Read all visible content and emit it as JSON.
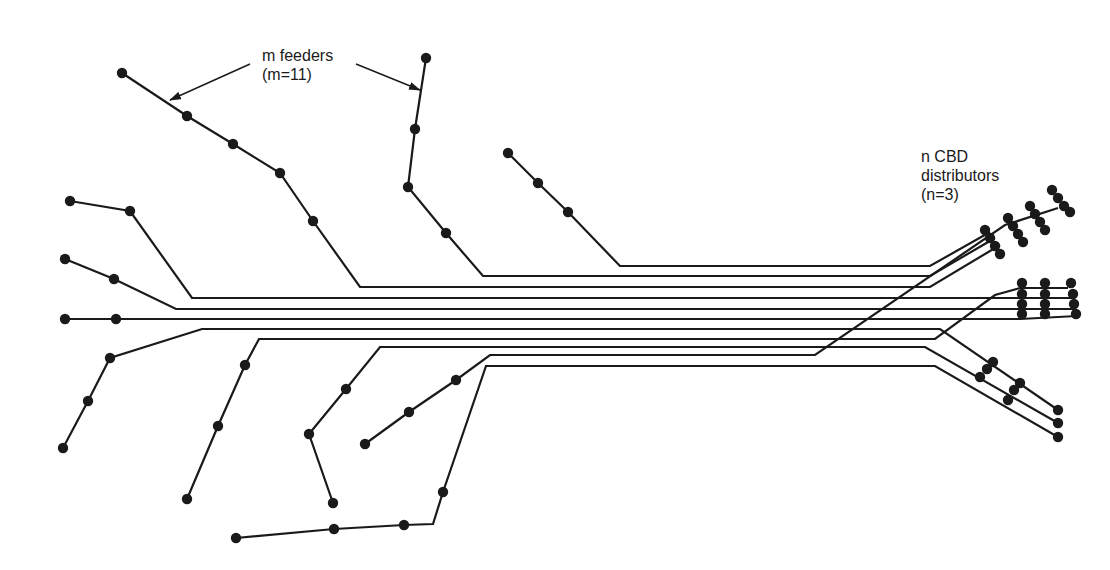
{
  "diagram": {
    "stroke_color": "#1a1a1a",
    "background": "#ffffff",
    "labels": {
      "feeders_line1": "m feeders",
      "feeders_line2": "(m=11)",
      "distributors_line1": "n CBD",
      "distributors_line2": "distributors",
      "distributors_line3": "(n=3)"
    },
    "annotation_arrows": [
      {
        "from": [
          250,
          64
        ],
        "to": [
          170,
          100
        ]
      },
      {
        "from": [
          356,
          64
        ],
        "to": [
          420,
          90
        ]
      }
    ],
    "feeders": [
      {
        "id": "f1",
        "points": [
          [
            122,
            73
          ],
          [
            187,
            116
          ],
          [
            233,
            144
          ],
          [
            280,
            173
          ],
          [
            313,
            221
          ],
          [
            360,
            287
          ],
          [
            930,
            287
          ],
          [
            1000,
            245
          ]
        ],
        "nodes": [
          [
            122,
            73
          ],
          [
            187,
            116
          ],
          [
            233,
            144
          ],
          [
            280,
            173
          ],
          [
            313,
            221
          ]
        ]
      },
      {
        "id": "f2",
        "points": [
          [
            426,
            58
          ],
          [
            415,
            129
          ],
          [
            408,
            187
          ],
          [
            446,
            233
          ],
          [
            483,
            276
          ],
          [
            930,
            276
          ],
          [
            995,
            238
          ]
        ],
        "nodes": [
          [
            426,
            58
          ],
          [
            415,
            129
          ],
          [
            408,
            187
          ],
          [
            446,
            233
          ]
        ]
      },
      {
        "id": "f3",
        "points": [
          [
            508,
            153
          ],
          [
            538,
            183
          ],
          [
            568,
            212
          ],
          [
            620,
            266
          ],
          [
            930,
            266
          ],
          [
            990,
            232
          ]
        ],
        "nodes": [
          [
            508,
            153
          ],
          [
            538,
            183
          ],
          [
            568,
            212
          ]
        ]
      },
      {
        "id": "f4",
        "points": [
          [
            70,
            201
          ],
          [
            130,
            211
          ],
          [
            192,
            298
          ],
          [
            1020,
            298
          ],
          [
            1071,
            298
          ]
        ],
        "nodes": [
          [
            70,
            201
          ],
          [
            130,
            211
          ]
        ]
      },
      {
        "id": "f5",
        "points": [
          [
            65,
            259
          ],
          [
            114,
            279
          ],
          [
            176,
            309
          ],
          [
            1020,
            309
          ],
          [
            1075,
            309
          ]
        ],
        "nodes": [
          [
            65,
            259
          ],
          [
            114,
            279
          ]
        ]
      },
      {
        "id": "f6",
        "points": [
          [
            65,
            319
          ],
          [
            116,
            319
          ],
          [
            1020,
            319
          ],
          [
            1077,
            316
          ]
        ],
        "nodes": [
          [
            65,
            319
          ],
          [
            116,
            319
          ]
        ]
      },
      {
        "id": "f7",
        "points": [
          [
            63,
            448
          ],
          [
            88,
            401
          ],
          [
            110,
            358
          ],
          [
            202,
            329
          ],
          [
            940,
            329
          ],
          [
            1058,
            410
          ]
        ],
        "nodes": [
          [
            63,
            448
          ],
          [
            88,
            401
          ],
          [
            110,
            358
          ]
        ]
      },
      {
        "id": "f8",
        "points": [
          [
            187,
            499
          ],
          [
            218,
            426
          ],
          [
            245,
            365
          ],
          [
            259,
            339
          ],
          [
            935,
            339
          ],
          [
            995,
            295
          ],
          [
            1020,
            288
          ],
          [
            1068,
            288
          ]
        ],
        "nodes": [
          [
            187,
            499
          ],
          [
            218,
            426
          ],
          [
            245,
            365
          ]
        ]
      },
      {
        "id": "f9",
        "points": [
          [
            333,
            503
          ],
          [
            309,
            434
          ],
          [
            346,
            389
          ],
          [
            380,
            347
          ],
          [
            925,
            347
          ],
          [
            1058,
            423
          ]
        ],
        "nodes": [
          [
            333,
            503
          ],
          [
            309,
            434
          ],
          [
            346,
            389
          ]
        ]
      },
      {
        "id": "f10",
        "points": [
          [
            365,
            444
          ],
          [
            409,
            412
          ],
          [
            456,
            380
          ],
          [
            490,
            355
          ],
          [
            815,
            355
          ],
          [
            1005,
            225
          ],
          [
            1058,
            208
          ]
        ],
        "nodes": [
          [
            365,
            444
          ],
          [
            409,
            412
          ],
          [
            456,
            380
          ]
        ]
      },
      {
        "id": "f11",
        "points": [
          [
            236,
            538
          ],
          [
            334,
            529
          ],
          [
            404,
            525
          ],
          [
            433,
            524
          ],
          [
            443,
            492
          ],
          [
            486,
            366
          ],
          [
            935,
            366
          ],
          [
            1058,
            437
          ]
        ],
        "nodes": [
          [
            236,
            538
          ],
          [
            334,
            529
          ],
          [
            404,
            525
          ],
          [
            443,
            492
          ]
        ]
      }
    ],
    "distributor_groups": [
      {
        "id": "upper",
        "nodes": [
          [
            985,
            230
          ],
          [
            990,
            238
          ],
          [
            995,
            246
          ],
          [
            1000,
            254
          ],
          [
            1008,
            218
          ],
          [
            1013,
            226
          ],
          [
            1018,
            234
          ],
          [
            1023,
            242
          ],
          [
            1030,
            206
          ],
          [
            1035,
            214
          ],
          [
            1040,
            222
          ],
          [
            1045,
            230
          ],
          [
            1052,
            190
          ],
          [
            1058,
            198
          ],
          [
            1064,
            206
          ],
          [
            1070,
            212
          ]
        ]
      },
      {
        "id": "middle",
        "nodes": [
          [
            1022,
            283
          ],
          [
            1022,
            294
          ],
          [
            1022,
            304
          ],
          [
            1022,
            314
          ],
          [
            1045,
            283
          ],
          [
            1045,
            294
          ],
          [
            1045,
            304
          ],
          [
            1045,
            314
          ],
          [
            1071,
            283
          ],
          [
            1073,
            294
          ],
          [
            1074,
            304
          ],
          [
            1076,
            314
          ]
        ]
      },
      {
        "id": "lower",
        "nodes": [
          [
            993,
            362
          ],
          [
            987,
            369
          ],
          [
            980,
            377
          ],
          [
            1020,
            383
          ],
          [
            1014,
            390
          ],
          [
            1008,
            400
          ],
          [
            1058,
            410
          ],
          [
            1058,
            423
          ],
          [
            1058,
            437
          ]
        ]
      }
    ]
  }
}
